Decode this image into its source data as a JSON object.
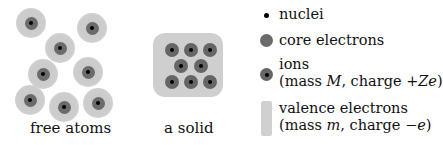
{
  "captions": {
    "free_atoms": "free atoms",
    "solid": "a solid"
  },
  "legend": {
    "nuclei": "nuclei",
    "core_electrons": "core electrons",
    "ions": {
      "line1": "ions",
      "line2_prefix": "(mass ",
      "line2_mass_symbol": "M",
      "line2_mid": ", charge +",
      "line2_charge_symbol": "Ze",
      "line2_suffix": ")"
    },
    "valence_electrons": {
      "line1": "valence electrons",
      "line2_prefix": "(mass ",
      "line2_mass_symbol": "m",
      "line2_mid": ", charge −",
      "line2_charge_symbol": "e",
      "line2_suffix": ")"
    }
  },
  "colors": {
    "nucleus": "#000000",
    "core_electrons": "#6b6b6b",
    "valence_electrons": "#cfcfcf"
  },
  "free_atoms_count": 8,
  "solid_ions_layout": [
    3,
    2,
    3
  ]
}
